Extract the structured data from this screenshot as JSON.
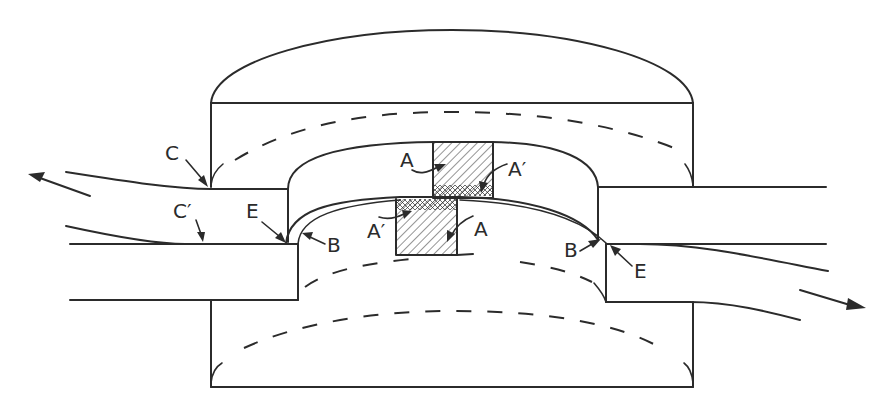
{
  "diagram": {
    "stroke_color": "#2b2b2b",
    "background": "#ffffff",
    "labels": {
      "C": "C",
      "C_prime": "C′",
      "E_left": "E",
      "B_left": "B",
      "A_upper": "A",
      "A_prime_upper": "A′",
      "A_prime_lower": "A′",
      "A_lower": "A",
      "B_right": "B",
      "E_right": "E"
    },
    "flow_arrows": [
      {
        "name": "left-outflow-arrow",
        "direction": "up-left"
      },
      {
        "name": "right-outflow-arrow",
        "direction": "down-right"
      }
    ],
    "hatched_blocks": [
      {
        "name": "upper-hatched-block",
        "pattern": "diagonal-hatch with crosshatch base"
      },
      {
        "name": "lower-hatched-block",
        "pattern": "diagonal-hatch with crosshatch top"
      }
    ]
  }
}
